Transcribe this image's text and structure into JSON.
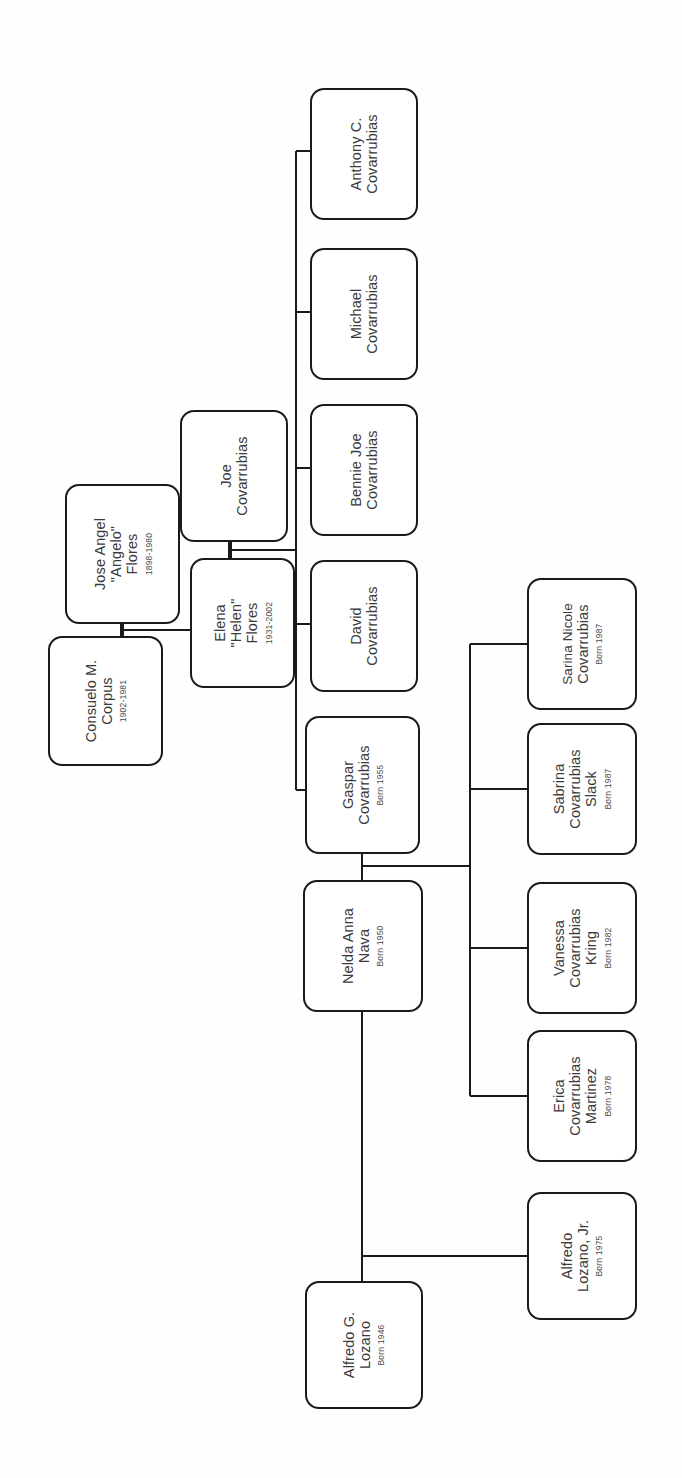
{
  "document": {
    "type": "family-tree-chart",
    "orientation": "rotated-90-counterclockwise",
    "background_color": "#fefefe",
    "line_color": "#1a1a1a",
    "text_color": "#3a3a3a"
  },
  "labels": {
    "born_prefix": "Born"
  },
  "people": [
    {
      "id": "anthony-c-covarrubias",
      "name_lines": [
        "Anthony C.",
        "Covarrubias"
      ],
      "dates": "",
      "generation": "grandchild-row",
      "box": {
        "x": 310,
        "y": 88,
        "w": 108,
        "h": 132
      }
    },
    {
      "id": "michael-covarrubias",
      "name_lines": [
        "Michael",
        "Covarrubias"
      ],
      "dates": "",
      "generation": "grandchild-row",
      "box": {
        "x": 310,
        "y": 248,
        "w": 108,
        "h": 132
      }
    },
    {
      "id": "bennie-joe-covarrubias",
      "name_lines": [
        "Bennie Joe",
        "Covarrubias"
      ],
      "dates": "",
      "generation": "grandchild-row",
      "box": {
        "x": 310,
        "y": 404,
        "w": 108,
        "h": 132
      }
    },
    {
      "id": "david-covarrubias",
      "name_lines": [
        "David",
        "Covarrubias"
      ],
      "dates": "",
      "generation": "grandchild-row",
      "box": {
        "x": 310,
        "y": 560,
        "w": 108,
        "h": 132
      }
    },
    {
      "id": "gaspar-covarrubias",
      "name_lines": [
        "Gaspar",
        "Covarrubias"
      ],
      "dates": "Born 1955",
      "generation": "grandchild-row",
      "box": {
        "x": 305,
        "y": 716,
        "w": 115,
        "h": 138
      }
    },
    {
      "id": "jose-angel-flores",
      "name_lines": [
        "Jose Angel",
        "\"Angelo\"",
        "Flores"
      ],
      "dates": "1898-1980",
      "generation": "great-grandparent",
      "box": {
        "x": 65,
        "y": 484,
        "w": 115,
        "h": 140
      }
    },
    {
      "id": "consuelo-m-corpus",
      "name_lines": [
        "Consuelo M.",
        "Corpus"
      ],
      "dates": "1902-1981",
      "generation": "great-grandparent",
      "box": {
        "x": 48,
        "y": 636,
        "w": 115,
        "h": 130
      }
    },
    {
      "id": "joe-covarrubias",
      "name_lines": [
        "Joe",
        "Covarrubias"
      ],
      "dates": "",
      "generation": "grandparent",
      "box": {
        "x": 180,
        "y": 410,
        "w": 108,
        "h": 132
      }
    },
    {
      "id": "elena-helen-flores",
      "name_lines": [
        "Elena",
        "\"Helen\"",
        "Flores"
      ],
      "dates": "1931-2002",
      "generation": "grandparent",
      "box": {
        "x": 190,
        "y": 558,
        "w": 105,
        "h": 130
      }
    },
    {
      "id": "nelda-anna-nava",
      "name_lines": [
        "Nelda Anna",
        "Nava"
      ],
      "dates": "Born 1950",
      "generation": "parent",
      "box": {
        "x": 303,
        "y": 880,
        "w": 120,
        "h": 132
      }
    },
    {
      "id": "sarina-nicole-covarrubias",
      "name_lines": [
        "Sarina Nicole",
        "Covarrubias"
      ],
      "dates": "Born 1987",
      "generation": "child",
      "box": {
        "x": 527,
        "y": 578,
        "w": 110,
        "h": 132
      }
    },
    {
      "id": "sabrina-covarrubias-slack",
      "name_lines": [
        "Sabrina",
        "Covarrubias",
        "Slack"
      ],
      "dates": "Born 1987",
      "generation": "child",
      "box": {
        "x": 527,
        "y": 723,
        "w": 110,
        "h": 132
      }
    },
    {
      "id": "vanessa-covarrubias-kring",
      "name_lines": [
        "Vanessa",
        "Covarrubias",
        "Kring"
      ],
      "dates": "Born 1982",
      "generation": "child",
      "box": {
        "x": 527,
        "y": 882,
        "w": 110,
        "h": 132
      }
    },
    {
      "id": "erica-covarrubias-martinez",
      "name_lines": [
        "Erica",
        "Covarrubias",
        "Martinez"
      ],
      "dates": "Born 1978",
      "generation": "child",
      "box": {
        "x": 527,
        "y": 1030,
        "w": 110,
        "h": 132
      }
    },
    {
      "id": "alfredo-lozano-jr",
      "name_lines": [
        "Alfredo",
        "Lozano, Jr."
      ],
      "dates": "Born 1975",
      "generation": "child",
      "box": {
        "x": 527,
        "y": 1192,
        "w": 110,
        "h": 128
      }
    },
    {
      "id": "alfredo-g-lozano",
      "name_lines": [
        "Alfredo G.",
        "Lozano"
      ],
      "dates": "Born 1946",
      "generation": "spouse",
      "box": {
        "x": 305,
        "y": 1281,
        "w": 118,
        "h": 128
      }
    }
  ],
  "connections": [
    {
      "id": "flores-corpus-marriage",
      "from": "jose-angel-flores",
      "to": "consuelo-m-corpus",
      "kind": "marriage"
    },
    {
      "id": "flores-to-elena",
      "from": "flores-corpus-marriage",
      "to": "elena-helen-flores",
      "kind": "descent"
    },
    {
      "id": "joe-elena-marriage",
      "from": "joe-covarrubias",
      "to": "elena-helen-flores",
      "kind": "marriage"
    },
    {
      "id": "joe-elena-children-bus",
      "from": "joe-elena-marriage",
      "to": "grandchild-row",
      "kind": "sibling-bus"
    },
    {
      "id": "gaspar-nelda-marriage",
      "from": "gaspar-covarrubias",
      "to": "nelda-anna-nava",
      "kind": "marriage"
    },
    {
      "id": "nelda-children-bus",
      "from": "gaspar-nelda-marriage",
      "to": "child-row",
      "kind": "sibling-bus"
    },
    {
      "id": "nelda-alfredo-marriage",
      "from": "nelda-anna-nava",
      "to": "alfredo-g-lozano",
      "kind": "marriage"
    },
    {
      "id": "alfredo-to-jr",
      "from": "nelda-alfredo-marriage",
      "to": "alfredo-lozano-jr",
      "kind": "descent"
    }
  ]
}
